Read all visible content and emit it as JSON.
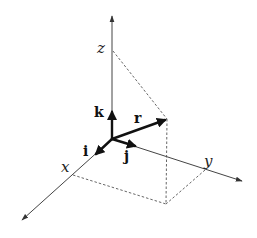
{
  "diagram": {
    "axes": {
      "x": {
        "label": "x"
      },
      "y": {
        "label": "y"
      },
      "z": {
        "label": "z"
      }
    },
    "vectors": {
      "r": {
        "label": "r"
      },
      "i": {
        "label": "i"
      },
      "j": {
        "label": "j"
      },
      "k": {
        "label": "k"
      }
    },
    "colors": {
      "axis": "#444444",
      "vector": "#111111",
      "dashed": "#555555",
      "background": "#ffffff"
    }
  }
}
